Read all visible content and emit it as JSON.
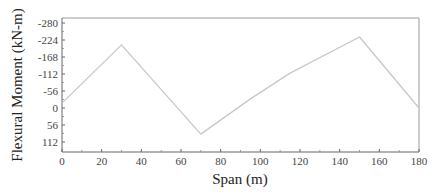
{
  "chart_data": {
    "type": "line",
    "title": "",
    "xlabel": "Span (m)",
    "ylabel": "Flexural Moment (kN-m)",
    "xlim": [
      0,
      180
    ],
    "ylim": [
      -280,
      140
    ],
    "y_inverted": true,
    "grid": false,
    "legend": null,
    "x_ticks": [
      0,
      20,
      40,
      60,
      80,
      100,
      120,
      140,
      160,
      180
    ],
    "y_ticks": [
      -280,
      -224,
      -168,
      -112,
      -56,
      0,
      56,
      112
    ],
    "series": [
      {
        "name": "Flexural Moment",
        "color": "#c8c8c8",
        "x": [
          0,
          30,
          70,
          95,
          115,
          150,
          180
        ],
        "y": [
          -16,
          -208,
          86,
          -30,
          -115,
          -234,
          0
        ]
      }
    ]
  },
  "labels": {
    "xlabel": "Span (m)",
    "ylabel": "Flexural Moment (kN-m)"
  }
}
